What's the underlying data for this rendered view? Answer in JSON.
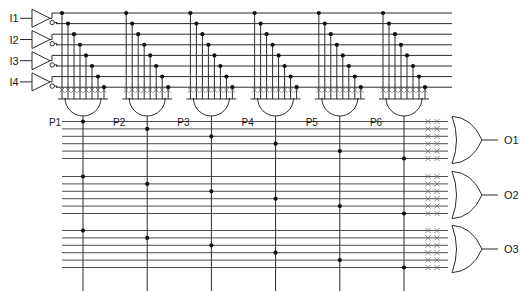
{
  "diagram": {
    "type": "pla-schematic",
    "colors": {
      "wire": "#2b2b2b",
      "dot": "#111111",
      "cross": "#6b6b6b",
      "background": "#ffffff",
      "text": "#1a1a1a"
    }
  },
  "inputs": {
    "count": 4,
    "labels": [
      "I1",
      "I2",
      "I3",
      "I4"
    ],
    "buffer_icon": "buffer-inverter-triangle",
    "lines_per_input": 2,
    "total_input_lines": 8
  },
  "product_terms": {
    "count": 6,
    "labels": [
      "P1",
      "P2",
      "P3",
      "P4",
      "P5",
      "P6"
    ],
    "gate_icon": "and-gate",
    "inputs_per_gate": 8,
    "cross_marker": "x-connection-marker"
  },
  "outputs": {
    "count": 3,
    "labels": [
      "O1",
      "O2",
      "O3"
    ],
    "gate_icon": "or-gate",
    "inputs_per_gate": 6,
    "cross_marker": "x-connection-marker"
  },
  "arrays": {
    "and_array_label": "AND plane",
    "or_array_label": "OR plane",
    "dot_icon": "connection-dot"
  },
  "chart_data": {
    "type": "table",
    "and_plane_dots": [
      {
        "term": "P1",
        "line_indices": [
          0,
          1,
          2,
          3,
          4,
          5,
          6,
          7
        ]
      },
      {
        "term": "P2",
        "line_indices": [
          0,
          1,
          2,
          3,
          4,
          5,
          6,
          7
        ]
      },
      {
        "term": "P3",
        "line_indices": [
          0,
          1,
          2,
          3,
          4,
          5,
          6,
          7
        ]
      },
      {
        "term": "P4",
        "line_indices": [
          0,
          1,
          2,
          3,
          4,
          5,
          6,
          7
        ]
      },
      {
        "term": "P5",
        "line_indices": [
          0,
          1,
          2,
          3,
          4,
          5,
          6,
          7
        ]
      },
      {
        "term": "P6",
        "line_indices": [
          0,
          1,
          2,
          3,
          4,
          5,
          6,
          7
        ]
      }
    ],
    "or_plane_dots": [
      {
        "output": "O1",
        "terms": [
          "P1",
          "P2",
          "P3",
          "P4",
          "P5",
          "P6"
        ]
      },
      {
        "output": "O2",
        "terms": [
          "P1",
          "P2",
          "P3",
          "P4",
          "P5",
          "P6"
        ]
      },
      {
        "output": "O3",
        "terms": [
          "P1",
          "P2",
          "P3",
          "P4",
          "P5",
          "P6"
        ]
      }
    ]
  }
}
